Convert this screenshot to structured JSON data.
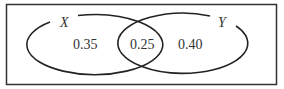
{
  "diagram": {
    "type": "venn",
    "universe_border_color": "#333333",
    "stroke_color": "#222222",
    "sets": [
      {
        "name": "X",
        "label": "X"
      },
      {
        "name": "Y",
        "label": "Y"
      }
    ],
    "regions": {
      "x_only": "0.35",
      "x_and_y": "0.25",
      "y_only": "0.40"
    }
  }
}
